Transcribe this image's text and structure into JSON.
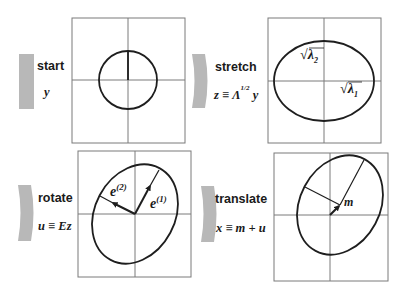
{
  "diagram": {
    "title": "",
    "colors": {
      "chevron": "#b8b8b8",
      "grid_line": "#7a7a7a",
      "curve": "#1e1e1e",
      "background": "#ffffff"
    },
    "steps": [
      {
        "id": "start",
        "label": "start",
        "equation": "y",
        "shape": "circle",
        "annotations": []
      },
      {
        "id": "stretch",
        "label": "stretch",
        "equation_lhs": "z ≡ Λ",
        "equation_exponent": "1/2",
        "equation_rhs": " y",
        "shape": "axis-aligned ellipse",
        "annotations": [
          "√λ₂",
          "√λ₁"
        ]
      },
      {
        "id": "rotate",
        "label": "rotate",
        "equation": "u ≡ Ez",
        "shape": "rotated ellipse",
        "annotations": [
          "e(2)",
          "e(1)"
        ]
      },
      {
        "id": "translate",
        "label": "translate",
        "equation": "x ≡ m + u",
        "shape": "translated rotated ellipse",
        "annotations": [
          "m"
        ]
      }
    ],
    "labels": {
      "sqrt_lambda2_radical": "√",
      "sqrt_lambda2_body": "λ",
      "sqrt_lambda2_sub": "2",
      "sqrt_lambda1_radical": "√",
      "sqrt_lambda1_body": "λ",
      "sqrt_lambda1_sub": "1",
      "e2_base": "e",
      "e2_sup": "(2)",
      "e1_base": "e",
      "e1_sup": "(1)",
      "m": "m"
    }
  }
}
